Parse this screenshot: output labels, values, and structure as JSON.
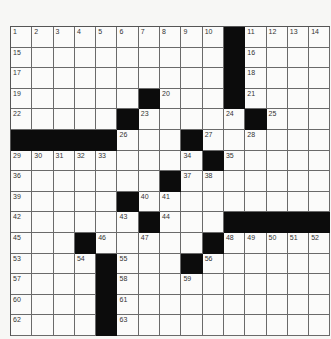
{
  "puzzle": {
    "rows": 15,
    "cols": 15,
    "colors": {
      "black": "#0c0c0c",
      "white": "#fbfbfa",
      "gridline": "#6a6a6a",
      "background": "#f7f7f5"
    },
    "black_cells": [
      [
        1,
        11
      ],
      [
        2,
        11
      ],
      [
        3,
        11
      ],
      [
        4,
        7
      ],
      [
        4,
        11
      ],
      [
        5,
        6
      ],
      [
        5,
        12
      ],
      [
        6,
        1
      ],
      [
        6,
        2
      ],
      [
        6,
        3
      ],
      [
        6,
        4
      ],
      [
        6,
        5
      ],
      [
        6,
        9
      ],
      [
        7,
        10
      ],
      [
        8,
        8
      ],
      [
        9,
        6
      ],
      [
        10,
        7
      ],
      [
        10,
        11
      ],
      [
        10,
        12
      ],
      [
        10,
        13
      ],
      [
        10,
        14
      ],
      [
        10,
        15
      ],
      [
        11,
        4
      ],
      [
        11,
        10
      ],
      [
        12,
        5
      ],
      [
        12,
        9
      ],
      [
        13,
        5
      ],
      [
        14,
        5
      ],
      [
        15,
        5
      ]
    ],
    "numbers": [
      {
        "r": 1,
        "c": 1,
        "n": "1"
      },
      {
        "r": 1,
        "c": 2,
        "n": "2"
      },
      {
        "r": 1,
        "c": 3,
        "n": "3"
      },
      {
        "r": 1,
        "c": 4,
        "n": "4"
      },
      {
        "r": 1,
        "c": 5,
        "n": "5"
      },
      {
        "r": 1,
        "c": 6,
        "n": "6"
      },
      {
        "r": 1,
        "c": 7,
        "n": "7"
      },
      {
        "r": 1,
        "c": 8,
        "n": "8"
      },
      {
        "r": 1,
        "c": 9,
        "n": "9"
      },
      {
        "r": 1,
        "c": 10,
        "n": "10"
      },
      {
        "r": 1,
        "c": 12,
        "n": "11"
      },
      {
        "r": 1,
        "c": 13,
        "n": "12"
      },
      {
        "r": 1,
        "c": 14,
        "n": "13"
      },
      {
        "r": 1,
        "c": 15,
        "n": "14"
      },
      {
        "r": 2,
        "c": 1,
        "n": "15"
      },
      {
        "r": 2,
        "c": 12,
        "n": "16"
      },
      {
        "r": 3,
        "c": 1,
        "n": "17"
      },
      {
        "r": 3,
        "c": 12,
        "n": "18"
      },
      {
        "r": 4,
        "c": 1,
        "n": "19"
      },
      {
        "r": 4,
        "c": 8,
        "n": "20"
      },
      {
        "r": 4,
        "c": 12,
        "n": "21"
      },
      {
        "r": 5,
        "c": 1,
        "n": "22"
      },
      {
        "r": 5,
        "c": 7,
        "n": "23"
      },
      {
        "r": 5,
        "c": 11,
        "n": "24"
      },
      {
        "r": 5,
        "c": 13,
        "n": "25"
      },
      {
        "r": 6,
        "c": 6,
        "n": "26"
      },
      {
        "r": 6,
        "c": 10,
        "n": "27"
      },
      {
        "r": 6,
        "c": 12,
        "n": "28"
      },
      {
        "r": 7,
        "c": 1,
        "n": "29"
      },
      {
        "r": 7,
        "c": 2,
        "n": "30"
      },
      {
        "r": 7,
        "c": 3,
        "n": "31"
      },
      {
        "r": 7,
        "c": 4,
        "n": "32"
      },
      {
        "r": 7,
        "c": 5,
        "n": "33"
      },
      {
        "r": 7,
        "c": 9,
        "n": "34"
      },
      {
        "r": 7,
        "c": 11,
        "n": "35"
      },
      {
        "r": 8,
        "c": 1,
        "n": "36"
      },
      {
        "r": 8,
        "c": 9,
        "n": "37"
      },
      {
        "r": 8,
        "c": 10,
        "n": "38"
      },
      {
        "r": 9,
        "c": 1,
        "n": "39"
      },
      {
        "r": 9,
        "c": 7,
        "n": "40"
      },
      {
        "r": 9,
        "c": 8,
        "n": "41"
      },
      {
        "r": 10,
        "c": 1,
        "n": "42"
      },
      {
        "r": 10,
        "c": 6,
        "n": "43"
      },
      {
        "r": 10,
        "c": 8,
        "n": "44"
      },
      {
        "r": 11,
        "c": 1,
        "n": "45"
      },
      {
        "r": 11,
        "c": 5,
        "n": "46"
      },
      {
        "r": 11,
        "c": 7,
        "n": "47"
      },
      {
        "r": 11,
        "c": 11,
        "n": "48"
      },
      {
        "r": 11,
        "c": 12,
        "n": "49"
      },
      {
        "r": 11,
        "c": 13,
        "n": "50"
      },
      {
        "r": 11,
        "c": 14,
        "n": "51"
      },
      {
        "r": 11,
        "c": 15,
        "n": "52"
      },
      {
        "r": 12,
        "c": 1,
        "n": "53"
      },
      {
        "r": 12,
        "c": 4,
        "n": "54"
      },
      {
        "r": 12,
        "c": 6,
        "n": "55"
      },
      {
        "r": 12,
        "c": 10,
        "n": "56"
      },
      {
        "r": 13,
        "c": 1,
        "n": "57"
      },
      {
        "r": 13,
        "c": 6,
        "n": "58"
      },
      {
        "r": 13,
        "c": 9,
        "n": "59"
      },
      {
        "r": 14,
        "c": 1,
        "n": "60"
      },
      {
        "r": 14,
        "c": 6,
        "n": "61"
      },
      {
        "r": 15,
        "c": 1,
        "n": "62"
      },
      {
        "r": 15,
        "c": 6,
        "n": "63"
      }
    ]
  }
}
